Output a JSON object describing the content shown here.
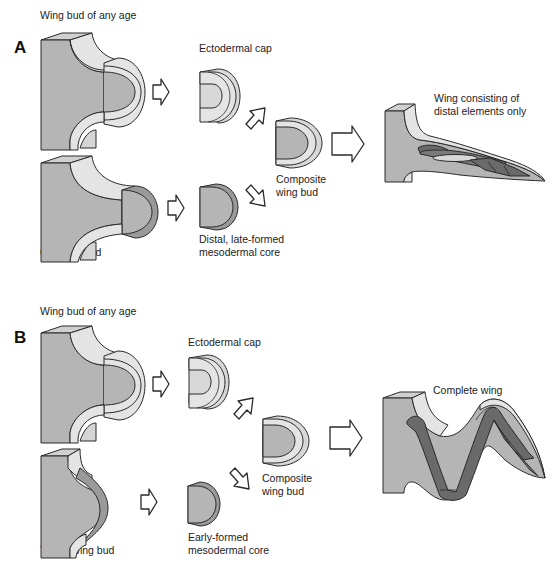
{
  "figure": {
    "colors": {
      "mesoderm": "#b5b5b5",
      "mesoderm_side": "#9a9a9a",
      "ectoderm": "#e4e4e4",
      "cartilage": "#6a6a6a",
      "outline": "#2a2a2a",
      "background": "#ffffff"
    },
    "panels": [
      {
        "letter": "A",
        "labels": {
          "top_source": "Wing bud of any age",
          "bottom_source": "Old wing bud",
          "ecto_cap": "Ectodermal cap",
          "meso_core_line1": "Distal, late-formed",
          "meso_core_line2": "mesodermal core",
          "composite_line1": "Composite",
          "composite_line2": "wing bud",
          "result_line1": "Wing consisting of",
          "result_line2": "distal elements only"
        }
      },
      {
        "letter": "B",
        "labels": {
          "top_source": "Wing bud of any age",
          "bottom_source": "Young wing bud",
          "ecto_cap": "Ectodermal cap",
          "meso_core_line1": "Early-formed",
          "meso_core_line2": "mesodermal core",
          "composite_line1": "Composite",
          "composite_line2": "wing bud",
          "result_line1": "Complete wing"
        }
      }
    ],
    "icons": [
      "arrow-right-icon",
      "arrow-diagonal-icon"
    ]
  }
}
